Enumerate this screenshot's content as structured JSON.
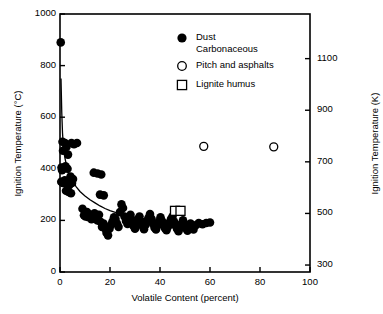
{
  "chart_data": {
    "type": "scatter",
    "title": "",
    "xlabel": "Volatile Content (percent)",
    "ylabel": "Ignition Temperature (°C)",
    "ylabel_right": "Ignition Temperature (K)",
    "xlim": [
      0,
      100
    ],
    "ylim": [
      0,
      1000
    ],
    "ylim_right": [
      273,
      1273
    ],
    "grid": false,
    "legend_position": "top-right-inside",
    "xticks": [
      0,
      20,
      40,
      60,
      80,
      100
    ],
    "xtick_labels": [
      "0",
      "20",
      "40",
      "60",
      "80",
      "100"
    ],
    "yticks": [
      0,
      200,
      400,
      600,
      800,
      1000
    ],
    "ytick_labels": [
      "0",
      "200",
      "400",
      "600",
      "800",
      "1000"
    ],
    "yticks_right": [
      300,
      500,
      700,
      900,
      1100
    ],
    "ytick_labels_right": [
      "300",
      "500",
      "700",
      "900",
      "1100"
    ],
    "series": [
      {
        "name": "Dust Carbonaceous",
        "marker": "filled-circle",
        "color": "#000000",
        "points": [
          [
            0.3,
            890
          ],
          [
            1.0,
            505
          ],
          [
            1.2,
            470
          ],
          [
            2.0,
            500
          ],
          [
            2.6,
            485
          ],
          [
            3.2,
            455
          ],
          [
            4.6,
            500
          ],
          [
            5.6,
            495
          ],
          [
            6.8,
            500
          ],
          [
            0.6,
            405
          ],
          [
            0.8,
            395
          ],
          [
            1.4,
            400
          ],
          [
            2.2,
            410
          ],
          [
            3.0,
            400
          ],
          [
            0.5,
            350
          ],
          [
            1.1,
            345
          ],
          [
            1.9,
            355
          ],
          [
            2.8,
            340
          ],
          [
            3.6,
            335
          ],
          [
            4.2,
            370
          ],
          [
            4.8,
            345
          ],
          [
            5.2,
            360
          ],
          [
            2.4,
            315
          ],
          [
            3.4,
            310
          ],
          [
            4.4,
            305
          ],
          [
            13.5,
            385
          ],
          [
            15.0,
            382
          ],
          [
            16.5,
            378
          ],
          [
            16.0,
            300
          ],
          [
            17.5,
            297
          ],
          [
            9.0,
            245
          ],
          [
            9.6,
            220
          ],
          [
            10.2,
            215
          ],
          [
            10.8,
            232
          ],
          [
            11.4,
            212
          ],
          [
            12.0,
            222
          ],
          [
            12.6,
            205
          ],
          [
            13.2,
            216
          ],
          [
            13.8,
            228
          ],
          [
            14.4,
            208
          ],
          [
            15.0,
            200
          ],
          [
            15.6,
            222
          ],
          [
            16.2,
            195
          ],
          [
            16.8,
            175
          ],
          [
            17.4,
            188
          ],
          [
            18.0,
            170
          ],
          [
            18.6,
            152
          ],
          [
            19.2,
            142
          ],
          [
            19.8,
            168
          ],
          [
            20.4,
            182
          ],
          [
            21.0,
            196
          ],
          [
            21.6,
            212
          ],
          [
            22.2,
            205
          ],
          [
            22.8,
            188
          ],
          [
            23.4,
            175
          ],
          [
            24.0,
            232
          ],
          [
            24.6,
            262
          ],
          [
            25.2,
            248
          ],
          [
            25.8,
            215
          ],
          [
            26.4,
            198
          ],
          [
            27.0,
            186
          ],
          [
            27.6,
            205
          ],
          [
            28.2,
            222
          ],
          [
            28.8,
            200
          ],
          [
            29.4,
            178
          ],
          [
            30.0,
            168
          ],
          [
            30.6,
            186
          ],
          [
            31.2,
            205
          ],
          [
            31.8,
            215
          ],
          [
            32.4,
            196
          ],
          [
            33.0,
            178
          ],
          [
            33.6,
            166
          ],
          [
            34.2,
            182
          ],
          [
            34.8,
            198
          ],
          [
            35.4,
            210
          ],
          [
            36.0,
            225
          ],
          [
            36.6,
            206
          ],
          [
            37.2,
            188
          ],
          [
            37.8,
            172
          ],
          [
            38.4,
            165
          ],
          [
            39.0,
            180
          ],
          [
            39.6,
            196
          ],
          [
            40.2,
            212
          ],
          [
            40.8,
            198
          ],
          [
            41.4,
            182
          ],
          [
            42.0,
            170
          ],
          [
            42.6,
            162
          ],
          [
            43.2,
            176
          ],
          [
            43.8,
            192
          ],
          [
            44.4,
            205
          ],
          [
            45.0,
            215
          ],
          [
            45.6,
            196
          ],
          [
            46.2,
            180
          ],
          [
            46.8,
            168
          ],
          [
            47.4,
            158
          ],
          [
            48.0,
            172
          ],
          [
            48.6,
            186
          ],
          [
            49.2,
            200
          ],
          [
            49.8,
            185
          ],
          [
            50.4,
            170
          ],
          [
            51.0,
            160
          ],
          [
            51.6,
            175
          ],
          [
            52.2,
            188
          ],
          [
            52.8,
            178
          ],
          [
            53.4,
            165
          ],
          [
            54.5,
            182
          ],
          [
            55.5,
            190
          ],
          [
            57.0,
            185
          ],
          [
            58.5,
            190
          ],
          [
            60.0,
            192
          ]
        ]
      },
      {
        "name": "Pitch and asphalts",
        "marker": "open-circle",
        "color": "#000000",
        "points": [
          [
            57.5,
            487
          ],
          [
            85.5,
            485
          ]
        ]
      },
      {
        "name": "Lignite humus",
        "marker": "open-square",
        "color": "#000000",
        "points": [
          [
            46.0,
            237
          ],
          [
            48.2,
            237
          ]
        ]
      }
    ],
    "fit_curve": {
      "name": "fitted trend",
      "points": [
        [
          0.4,
          750
        ],
        [
          0.7,
          620
        ],
        [
          1.0,
          540
        ],
        [
          1.4,
          480
        ],
        [
          2.0,
          440
        ],
        [
          2.8,
          405
        ],
        [
          3.8,
          378
        ],
        [
          5.0,
          352
        ],
        [
          6.5,
          330
        ],
        [
          8.0,
          312
        ],
        [
          10.0,
          295
        ],
        [
          12.0,
          280
        ],
        [
          14.0,
          268
        ],
        [
          16.0,
          256
        ],
        [
          18.0,
          246
        ],
        [
          20.0,
          238
        ],
        [
          23.0,
          228
        ],
        [
          26.0,
          220
        ],
        [
          29.0,
          214
        ],
        [
          32.0,
          209
        ],
        [
          36.0,
          203
        ],
        [
          40.0,
          199
        ],
        [
          45.0,
          195
        ],
        [
          50.0,
          192
        ],
        [
          55.0,
          190
        ],
        [
          60.0,
          189
        ]
      ]
    },
    "legend": [
      {
        "marker": "filled-circle",
        "label_line1": "Dust",
        "label_line2": "Carbonaceous"
      },
      {
        "marker": "open-circle",
        "label_line1": "Pitch and asphalts",
        "label_line2": ""
      },
      {
        "marker": "open-square",
        "label_line1": "Lignite humus",
        "label_line2": ""
      }
    ]
  },
  "axes": {
    "left_title": "Ignition Temperature (°C)",
    "right_title": "Ignition Temperature (K)",
    "bottom_title": "Volatile Content (percent)"
  },
  "colors": {
    "ink": "#000000",
    "background": "#ffffff",
    "curve": "#000000"
  }
}
